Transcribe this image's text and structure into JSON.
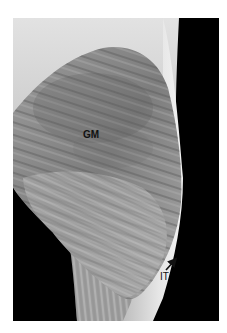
{
  "figure": {
    "labels": [
      {
        "id": "gm",
        "text": "GM"
      },
      {
        "id": "it",
        "text": "IT"
      }
    ],
    "arrow": {
      "points_to": "IT",
      "direction": "up-right"
    },
    "colors": {
      "background": "#ffffff",
      "photo_dark": "#000000",
      "muscle_mid": "#8a8a8a",
      "tissue_light": "#d8d8d8",
      "label_text": "#111111"
    }
  }
}
